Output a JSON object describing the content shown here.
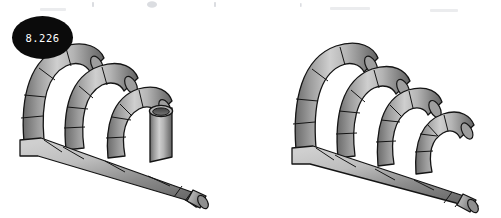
{
  "page": {
    "background_color": "#ffffff",
    "width": 501,
    "height": 218,
    "content_type": "technical-illustration-pair"
  },
  "figures": [
    {
      "id": "figure-8-226",
      "label": "8.226",
      "label_shape": "ellipse",
      "label_background": "#0b0b0b",
      "label_text_color": "#ffffff",
      "subject": "exhaust-header-manifold",
      "runner_count": 4,
      "runner_types": [
        "curved",
        "curved",
        "curved",
        "straight-stub"
      ],
      "collector": "diagonal-collector-tube",
      "collector_outlet": "banded-flange-end",
      "projection": "isometric",
      "alt": "Isometric view of a four-into-one exhaust header with three curved runners and one short straight stub merging into a diagonal collector pipe"
    },
    {
      "id": "figure-8-227",
      "label": "8.227",
      "label_shape": "ellipse",
      "label_background": "#0b0b0b",
      "label_text_color": "#ffffff",
      "subject": "exhaust-header-manifold",
      "runner_count": 4,
      "runner_types": [
        "curved",
        "curved",
        "curved",
        "curved"
      ],
      "collector": "diagonal-collector-tube",
      "collector_outlet": "banded-flange-end",
      "projection": "isometric",
      "alt": "Isometric view of a four-into-one exhaust header with four curved runners merging into a diagonal collector pipe"
    }
  ],
  "colors": {
    "pipe_light": "#d2d2d2",
    "pipe_mid": "#a8a8a8",
    "pipe_dark": "#6e6e6e",
    "pipe_darkest": "#555555",
    "outline": "#141414",
    "bore_dark": "#4a4a4a",
    "background": "#ffffff",
    "label_fill": "#0b0b0b",
    "label_text": "#ffffff"
  }
}
